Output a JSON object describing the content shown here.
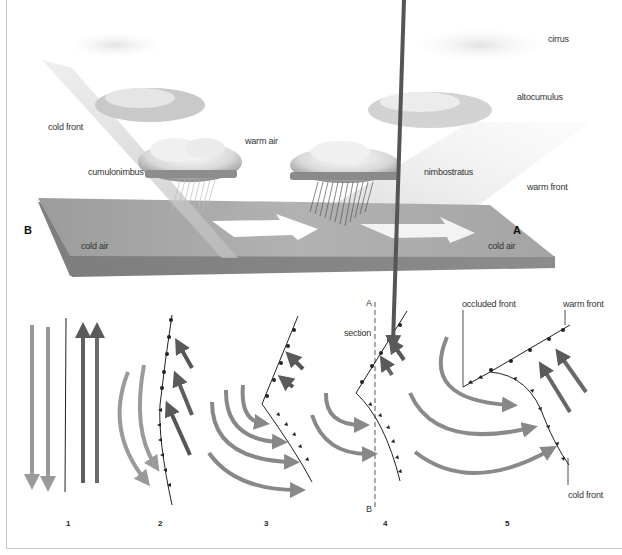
{
  "diagram": {
    "top_panel": {
      "labels": {
        "cirrus": "cirrus",
        "altocumulus": "altocumulus",
        "cold_front": "cold front",
        "warm_air": "warm air",
        "cumulonimbus": "cumulonimbus",
        "nimbostratus": "nimbostratus",
        "warm_front": "warm front",
        "point_b": "B",
        "point_a": "A",
        "cold_air_left": "cold air",
        "cold_air_right": "cold air"
      }
    },
    "bottom_panel": {
      "stages": [
        {
          "number": "1"
        },
        {
          "number": "2"
        },
        {
          "number": "3"
        },
        {
          "number": "4",
          "section_label": "section",
          "section_top": "A",
          "section_bottom": "B"
        },
        {
          "number": "5",
          "occluded_front": "occluded front",
          "warm_front": "warm front",
          "cold_front": "cold front"
        }
      ]
    },
    "colors": {
      "slab_top": "#a8a8a8",
      "slab_side": "#8e8e8e",
      "cold_arrow": "#9a9a9a",
      "warm_arrow": "#5e5e5e",
      "front_line": "#222222",
      "frame_border": "#c8c8c8"
    }
  }
}
